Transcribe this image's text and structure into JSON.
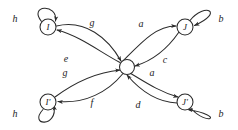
{
  "figure": {
    "kind": "state-transition-diagram",
    "colors": {
      "stroke": "#2b2b2b",
      "text": "#1c1c1c",
      "background": "#ffffff"
    },
    "center_node": {
      "label": "",
      "cx": 127,
      "cy": 67,
      "r": 7.5
    },
    "nodes": [
      {
        "id": "top-left",
        "label": "I",
        "cx": 48,
        "cy": 27,
        "r": 8
      },
      {
        "id": "top-right",
        "label": "J",
        "cx": 185,
        "cy": 27,
        "r": 8
      },
      {
        "id": "bottom-left",
        "label": "I'",
        "cx": 48,
        "cy": 102,
        "r": 8
      },
      {
        "id": "bottom-right",
        "label": "J'",
        "cx": 185,
        "cy": 102,
        "r": 8
      }
    ],
    "self_loops": [
      {
        "id": "loop-top-left",
        "node": "top-left",
        "label": "h",
        "label_x": 15,
        "label_y": 19
      },
      {
        "id": "loop-top-right",
        "node": "top-right",
        "label": "b",
        "label_x": 221,
        "label_y": 19
      },
      {
        "id": "loop-bottom-left",
        "node": "bottom-left",
        "label": "h",
        "label_x": 15,
        "label_y": 114
      },
      {
        "id": "loop-bottom-right",
        "node": "bottom-right",
        "label": "b",
        "label_x": 221,
        "label_y": 114
      }
    ],
    "edges": [
      {
        "id": "edge-g-upper",
        "from": "top-left",
        "to": "center",
        "label": "g",
        "label_x": 92,
        "label_y": 23
      },
      {
        "id": "edge-e",
        "from": "center",
        "to": "top-left",
        "label": "e",
        "label_x": 66,
        "label_y": 59
      },
      {
        "id": "edge-a-upper",
        "from": "center",
        "to": "top-right",
        "label": "a",
        "label_x": 141,
        "label_y": 24
      },
      {
        "id": "edge-c",
        "from": "top-right",
        "to": "center",
        "label": "c",
        "label_x": 165,
        "label_y": 60
      },
      {
        "id": "edge-g-lower",
        "from": "bottom-left",
        "to": "center",
        "label": "g",
        "label_x": 65,
        "label_y": 73
      },
      {
        "id": "edge-f",
        "from": "center",
        "to": "bottom-left",
        "label": "f",
        "label_x": 92,
        "label_y": 103
      },
      {
        "id": "edge-a-lower",
        "from": "center",
        "to": "bottom-right",
        "label": "a",
        "label_x": 152,
        "label_y": 73
      },
      {
        "id": "edge-d",
        "from": "bottom-right",
        "to": "center",
        "label": "d",
        "label_x": 138,
        "label_y": 105
      }
    ]
  }
}
